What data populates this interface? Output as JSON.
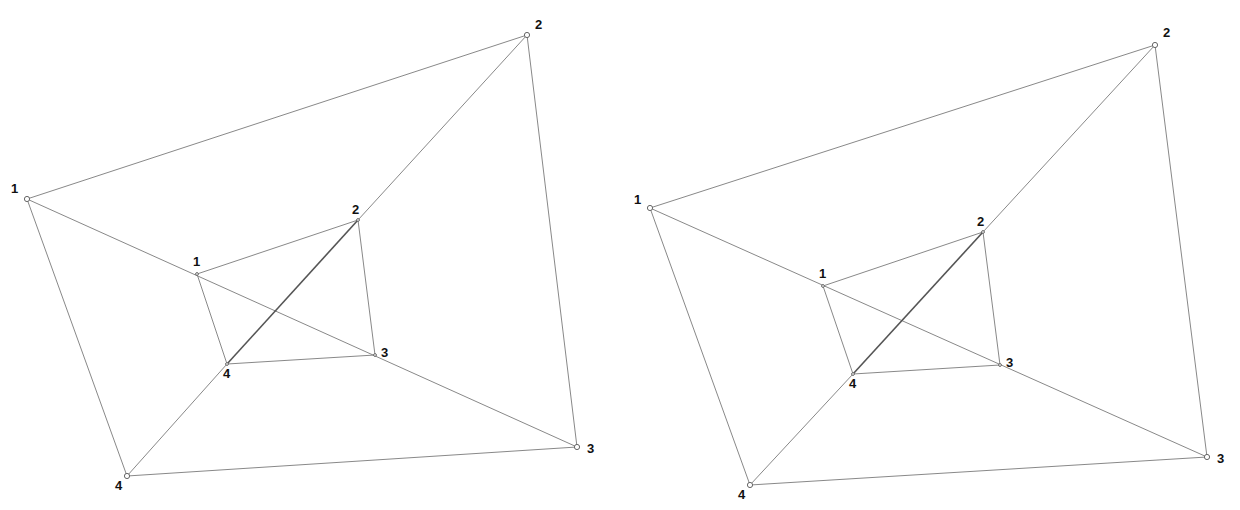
{
  "figures": [
    {
      "name": "left-figure",
      "outer": {
        "labels": [
          "1",
          "2",
          "3",
          "4"
        ],
        "points": [
          [
            27,
            199
          ],
          [
            527,
            35
          ],
          [
            577,
            447
          ],
          [
            127,
            476
          ]
        ],
        "label_offsets": [
          [
            -16,
            -6
          ],
          [
            8,
            -6
          ],
          [
            10,
            6
          ],
          [
            -12,
            14
          ]
        ]
      },
      "inner": {
        "labels": [
          "1",
          "2",
          "3",
          "4"
        ],
        "points": [
          [
            197,
            274
          ],
          [
            358,
            220
          ],
          [
            375,
            355
          ],
          [
            227,
            364
          ]
        ],
        "label_offsets": [
          [
            -4,
            -8
          ],
          [
            -6,
            -6
          ],
          [
            6,
            2
          ],
          [
            -4,
            14
          ]
        ]
      }
    },
    {
      "name": "right-figure",
      "outer": {
        "labels": [
          "1",
          "2",
          "3",
          "4"
        ],
        "points": [
          [
            650,
            208
          ],
          [
            1155,
            45
          ],
          [
            1207,
            457
          ],
          [
            750,
            485
          ]
        ],
        "label_offsets": [
          [
            -16,
            -4
          ],
          [
            8,
            -8
          ],
          [
            10,
            6
          ],
          [
            -12,
            14
          ]
        ]
      },
      "inner": {
        "labels": [
          "1",
          "2",
          "3",
          "4"
        ],
        "points": [
          [
            823,
            286
          ],
          [
            983,
            232
          ],
          [
            1000,
            365
          ],
          [
            853,
            374
          ]
        ],
        "label_offsets": [
          [
            -4,
            -8
          ],
          [
            -6,
            -6
          ],
          [
            6,
            2
          ],
          [
            -4,
            14
          ]
        ]
      }
    }
  ]
}
